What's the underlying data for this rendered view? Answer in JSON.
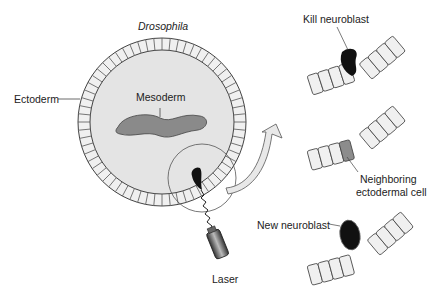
{
  "diagram": {
    "title": "Drosophila",
    "labels": {
      "ectoderm": "Ectoderm",
      "mesoderm": "Mesoderm",
      "laser": "Laser",
      "kill_neuroblast": "Kill neuroblast",
      "neighboring_line1": "Neighboring",
      "neighboring_line2": "ectodermal cell",
      "new_neuroblast": "New neuroblast"
    },
    "colors": {
      "embryo_fill": "#e4e4e4",
      "cell_fill": "#f0f0f0",
      "mesoderm_fill": "#8a8a8a",
      "neuroblast_fill": "#111111",
      "neighbor_cell_fill": "#8c8c8c",
      "outline": "#444444"
    },
    "panels": [
      {
        "step": 1,
        "caption": "Kill neuroblast"
      },
      {
        "step": 2,
        "caption": "Neighboring ectodermal cell"
      },
      {
        "step": 3,
        "caption": "New neuroblast"
      }
    ]
  }
}
